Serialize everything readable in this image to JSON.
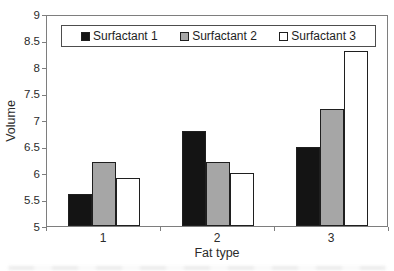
{
  "figure": {
    "background": "#ffffff",
    "axis_line_color": "#7e7e7e",
    "bar_border_color": "#1f1f1f"
  },
  "chart_data": {
    "type": "bar",
    "title": "",
    "xlabel": "Fat type",
    "ylabel": "Volume",
    "categories": [
      "1",
      "2",
      "3"
    ],
    "series": [
      {
        "name": "Surfactant 1",
        "color": "#141414",
        "values": [
          5.6,
          6.8,
          6.5
        ]
      },
      {
        "name": "Surfactant 2",
        "color": "#a6a6a6",
        "values": [
          6.2,
          6.2,
          7.2
        ]
      },
      {
        "name": "Surfactant 3",
        "color": "#ffffff",
        "values": [
          5.9,
          6.0,
          8.3
        ]
      }
    ],
    "ylim": [
      5,
      9
    ],
    "yticks": [
      9,
      8.5,
      8,
      7.5,
      7,
      6.5,
      6,
      5.5,
      5
    ],
    "grid": false,
    "legend_position": "top-inside",
    "legend_labels": [
      "Surfactant 1",
      "Surfactant 2",
      "Surfactant 3"
    ]
  }
}
